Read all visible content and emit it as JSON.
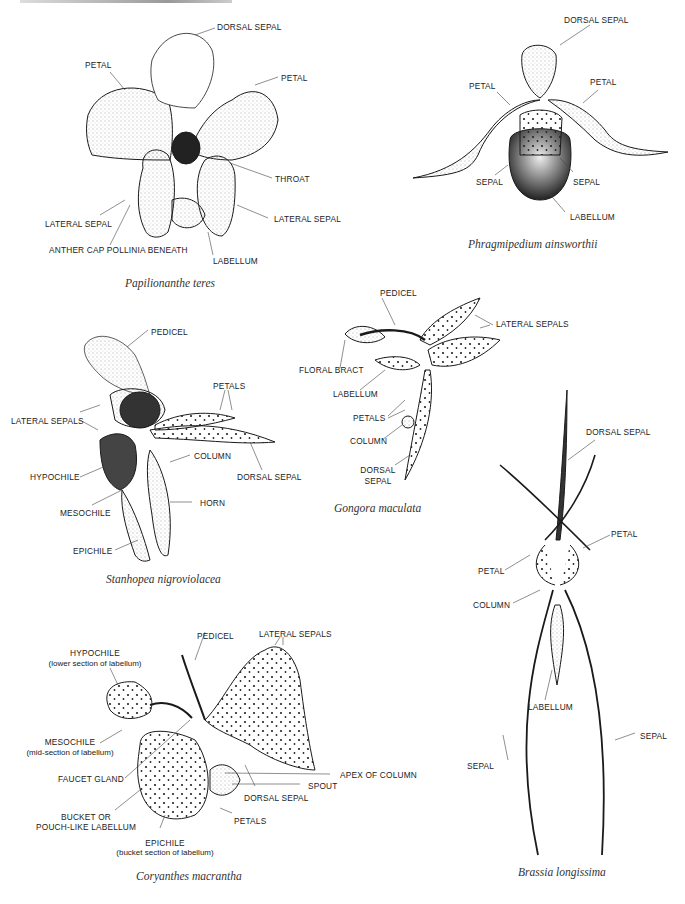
{
  "figures": [
    {
      "name": "papilionanthe",
      "caption": "Papilionanthe   teres",
      "labels": [
        "DORSAL SEPAL",
        "PETAL",
        "PETAL",
        "THROAT",
        "LATERAL SEPAL",
        "LATERAL SEPAL",
        "ANTHER CAP POLLINIA BENEATH",
        "LABELLUM"
      ]
    },
    {
      "name": "phragmipedium",
      "caption": "Phragmipedium ainsworthii",
      "labels": [
        "DORSAL SEPAL",
        "PETAL",
        "PETAL",
        "SEPAL",
        "SEPAL",
        "LABELLUM"
      ]
    },
    {
      "name": "stanhopea",
      "caption": "Stanhopea nigroviolacea",
      "labels": [
        "PEDICEL",
        "PETALS",
        "LATERAL SEPALS",
        "COLUMN",
        "DORSAL SEPAL",
        "HYPOCHILE",
        "HORN",
        "MESOCHILE",
        "EPICHILE"
      ]
    },
    {
      "name": "gongora",
      "caption": "Gongora maculata",
      "labels": [
        "PEDICEL",
        "LATERAL SEPALS",
        "FLORAL BRACT",
        "LABELLUM",
        "PETALS",
        "COLUMN",
        "DORSAL",
        "SEPAL"
      ]
    },
    {
      "name": "brassia",
      "caption": "Brassia longissima",
      "labels": [
        "DORSAL SEPAL",
        "PETAL",
        "PETAL",
        "COLUMN",
        "LABELLUM",
        "SEPAL",
        "SEPAL"
      ]
    },
    {
      "name": "coryanthes",
      "caption": "Coryanthes macrantha",
      "labels": [
        "PEDICEL",
        "LATERAL SEPALS",
        "HYPOCHILE",
        "(lower section of labellum)",
        "MESOCHILE",
        "(mid-section of labellum)",
        "FAUCET GLAND",
        "APEX OF COLUMN",
        "SPOUT",
        "DORSAL SEPAL",
        "BUCKET OR",
        "POUCH-LIKE LABELLUM",
        "PETALS",
        "EPICHILE",
        "(bucket section of labellum)"
      ]
    }
  ]
}
